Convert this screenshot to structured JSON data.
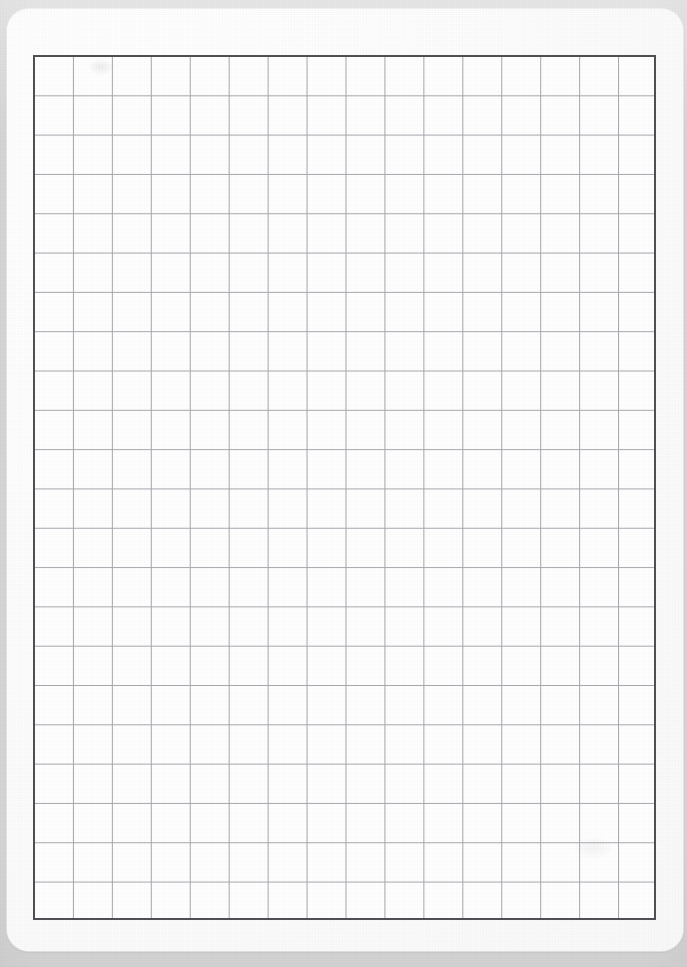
{
  "document": {
    "title": "Blank Grid Paper",
    "kind": "grid-paper-scan",
    "content_text": ""
  },
  "canvas": {
    "width_px": 687,
    "height_px": 967,
    "background_color": "#d9d9d9"
  },
  "paper": {
    "color": "#fefefe",
    "left_px": 7,
    "top_px": 9,
    "width_px": 676,
    "height_px": 942,
    "corner_radius_px": 22
  },
  "grid": {
    "columns": 16,
    "rows": 22,
    "cell_width_px": 38.94,
    "cell_height_px": 39.32,
    "left_px": 33,
    "top_px": 55,
    "width_px": 623,
    "height_px": 865,
    "line_color": "#a6a6ad",
    "line_width_px": 1,
    "border_color": "#4d4d52",
    "border_width_px": 2,
    "cell_fill_color": "#ffffff"
  },
  "marks": {
    "smudge_top_left": "faint-pencil-smudge",
    "smudge_bottom_right": "faint-pencil-smudge"
  },
  "chart_data": {
    "type": "table",
    "title": "",
    "xlabel": "",
    "ylabel": "",
    "columns": 16,
    "rows": 22,
    "categories": [],
    "values": [],
    "cells": [],
    "grid": true,
    "legend": "none",
    "note": "Empty grid / graph paper — no plotted data, labels, ticks, or annotations present."
  }
}
